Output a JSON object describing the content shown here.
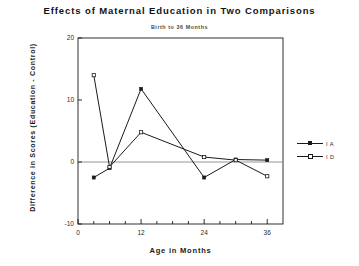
{
  "chart_data": {
    "type": "line",
    "title": "Effects of Maternal Education in Two Comparisons",
    "subtitle": "Birth to 36 Months",
    "xlabel": "Age in Months",
    "ylabel": "Difference in Scores (Education - Control)",
    "xlim": [
      0,
      39
    ],
    "ylim": [
      -10,
      20
    ],
    "yticks": [
      20,
      10,
      0,
      -10
    ],
    "ytick_labels": [
      "20",
      "10",
      "0",
      "-10"
    ],
    "xticks": [
      0,
      12,
      24,
      36
    ],
    "xtick_labels": [
      "0",
      "12",
      "24",
      "36"
    ],
    "xminor_step": 3,
    "grid": false,
    "zero_reference_line": 0,
    "legend_position": "right",
    "series": [
      {
        "name": "I A",
        "marker": "filled-square",
        "x": [
          3,
          6,
          12,
          24,
          30,
          36
        ],
        "y": [
          -2.5,
          -1.0,
          11.8,
          -2.5,
          0.4,
          0.3
        ]
      },
      {
        "name": "I D",
        "marker": "open-square",
        "x": [
          3,
          6,
          12,
          24,
          30,
          36
        ],
        "y": [
          14.0,
          -0.8,
          4.8,
          0.8,
          0.3,
          -2.3
        ]
      }
    ]
  },
  "legend": {
    "entries": [
      {
        "label": "I A"
      },
      {
        "label": "I D"
      }
    ]
  },
  "colors": {
    "line": "#1a1a1a",
    "axis": "#1a1a1a",
    "zero_line": "#888888",
    "background": "#ffffff",
    "text": "#1a1a1a"
  }
}
